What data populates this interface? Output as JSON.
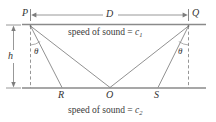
{
  "figure": {
    "title_alt": "Refraction seismic diagram with source P, receiver Q, refraction points R, O, S",
    "labels": {
      "p": "P",
      "q": "Q",
      "r": "R",
      "o": "O",
      "s": "S",
      "d": "D",
      "h": "h",
      "theta_left": "θ",
      "theta_right": "θ"
    },
    "annotations": {
      "upper_medium_prefix": "speed of sound = ",
      "upper_medium_symbol": "c",
      "upper_medium_sub": "1",
      "lower_medium_prefix": "speed of sound = ",
      "lower_medium_symbol": "c",
      "lower_medium_sub": "2"
    },
    "colors": {
      "stroke": "#7d7d7d",
      "stroke_dark": "#5a5a5a",
      "text": "#333333",
      "background": "#ffffff"
    },
    "geometry": {
      "p": [
        30,
        26
      ],
      "q": [
        189,
        26
      ],
      "r": [
        62,
        87
      ],
      "o": [
        110,
        87
      ],
      "s": [
        158,
        87
      ],
      "top_line_y": 24,
      "bottom_line_y": 88,
      "dimension_line_y": 15,
      "h_arrow_x": 13,
      "h_top": 25,
      "h_bottom": 88
    }
  }
}
